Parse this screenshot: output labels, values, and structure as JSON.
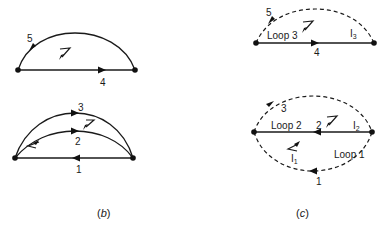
{
  "figure": {
    "panels": [
      {
        "id": "b",
        "caption_open": "(",
        "caption_letter": "b",
        "caption_close": ")",
        "graphs": [
          {
            "name": "tree-top",
            "edges": [
              {
                "label": "5",
                "type": "arc",
                "direction": "right-to-left",
                "style": "solid"
              },
              {
                "label": "4",
                "type": "line",
                "direction": "left-to-right",
                "style": "solid"
              }
            ]
          },
          {
            "name": "tree-bottom",
            "edges": [
              {
                "label": "3",
                "type": "arc",
                "direction": "left-to-right",
                "style": "solid"
              },
              {
                "label": "2",
                "type": "arc",
                "direction": "left-to-right",
                "style": "solid"
              },
              {
                "label": "1",
                "type": "line",
                "direction": "right-to-left",
                "style": "solid"
              }
            ]
          }
        ]
      },
      {
        "id": "c",
        "caption_open": "(",
        "caption_letter": "c",
        "caption_close": ")",
        "graphs": [
          {
            "name": "loop3-graph",
            "loop_label": "Loop 3",
            "current_label": "I",
            "current_sub": "3",
            "edges": [
              {
                "label": "5",
                "type": "arc",
                "direction": "right-to-left",
                "style": "dashed"
              },
              {
                "label": "4",
                "type": "line",
                "direction": "left-to-right",
                "style": "solid"
              }
            ]
          },
          {
            "name": "loop12-graph",
            "loop2_label": "Loop 2",
            "loop1_label": "Loop 1",
            "current2_label": "I",
            "current2_sub": "2",
            "current1_label": "I",
            "current1_sub": "1",
            "edges": [
              {
                "label": "3",
                "type": "arc",
                "direction": "left-to-right",
                "style": "dashed"
              },
              {
                "label": "2",
                "type": "line",
                "direction": "right-to-left",
                "style": "solid"
              },
              {
                "label": "1",
                "type": "arc",
                "direction": "right-to-left",
                "style": "dashed"
              }
            ]
          }
        ]
      }
    ]
  }
}
